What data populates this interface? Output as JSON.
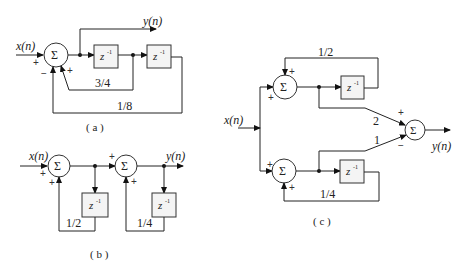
{
  "diagrams": {
    "a": {
      "caption": "( a )",
      "input_label": "x(n)",
      "output_label": "y(n)",
      "sum_symbol": "Σ",
      "delay_label": "z",
      "delay_exp": "-1",
      "gains": [
        "3/4",
        "1/8"
      ],
      "signs": {
        "input": "+",
        "feedback_3_4": "+",
        "feedback_1_8": "−"
      }
    },
    "b": {
      "caption": "( b )",
      "input_label": "x(n)",
      "output_label": "y(n)",
      "sum_symbol": "Σ",
      "delay_label": "z",
      "delay_exp": "-1",
      "gains": [
        "1/2",
        "1/4"
      ],
      "signs": {
        "sum1_input": "+",
        "sum1_feedback": "+",
        "sum2_input": "+",
        "sum2_feedback": "+"
      }
    },
    "c": {
      "caption": "( c )",
      "input_label": "x(n)",
      "output_label": "y(n)",
      "sum_symbol": "Σ",
      "delay_label": "z",
      "delay_exp": "-1",
      "gains": {
        "top_feedback": "1/2",
        "bottom_feedback": "1/4",
        "top_forward": "2",
        "bottom_forward": "1"
      },
      "signs": {
        "top_input": "+",
        "top_feedback": "+",
        "bottom_input": "+",
        "bottom_feedback": "+",
        "out_top": "+",
        "out_bottom": "−"
      }
    }
  }
}
